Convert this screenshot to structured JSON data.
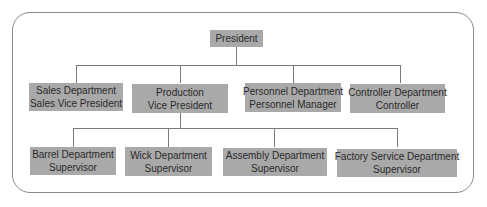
{
  "chart": {
    "root": {
      "title": "President"
    },
    "level2": [
      {
        "line1": "Sales Department",
        "line2": "Sales Vice President"
      },
      {
        "line1": "Production",
        "line2": "Vice President"
      },
      {
        "line1": "Personnel Department",
        "line2": "Personnel Manager"
      },
      {
        "line1": "Controller Department",
        "line2": "Controller"
      }
    ],
    "level3": [
      {
        "line1": "Barrel Department",
        "line2": "Supervisor"
      },
      {
        "line1": "Wick Department",
        "line2": "Supervisor"
      },
      {
        "line1": "Assembly Department",
        "line2": "Supervisor"
      },
      {
        "line1": "Factory Service Department",
        "line2": "Supervisor"
      }
    ]
  },
  "colors": {
    "box_fill": "#a9a9a9",
    "connector": "#7a7a7a",
    "frame_border": "#8a8a8a"
  }
}
